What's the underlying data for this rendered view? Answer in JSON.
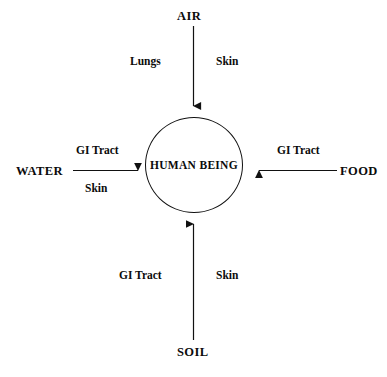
{
  "diagram": {
    "type": "routes-of-exposure-diagram",
    "center": {
      "label": "HUMAN BEING",
      "shape": "ellipse"
    },
    "stroke_color": "#111111",
    "text_color": "#0b0b0b",
    "background_color": "#ffffff",
    "pathways": [
      {
        "source": "AIR",
        "direction": "top-to-center",
        "arrow": "down",
        "routes": [
          {
            "label": "Lungs",
            "side": "left"
          },
          {
            "label": "Skin",
            "side": "right"
          }
        ]
      },
      {
        "source": "WATER",
        "direction": "left-to-center",
        "arrow": "right",
        "routes": [
          {
            "label": "GI Tract",
            "side": "above"
          },
          {
            "label": "Skin",
            "side": "below"
          }
        ]
      },
      {
        "source": "FOOD",
        "direction": "right-to-center",
        "arrow": "left",
        "routes": [
          {
            "label": "GI Tract",
            "side": "above"
          }
        ]
      },
      {
        "source": "SOIL",
        "direction": "bottom-to-center",
        "arrow": "up",
        "routes": [
          {
            "label": "GI Tract",
            "side": "left"
          },
          {
            "label": "Skin",
            "side": "right"
          }
        ]
      }
    ]
  }
}
